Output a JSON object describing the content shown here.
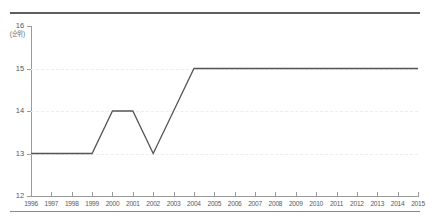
{
  "chart_data": {
    "type": "line",
    "title": "",
    "subtitle": "",
    "xlabel": "",
    "ylabel": "",
    "unit_label": "(순위)",
    "grid": true,
    "grid_orientation": "horizontal",
    "legend": false,
    "legend_position": "none",
    "y_axis_inverted": false,
    "xlim": [
      1996,
      2015
    ],
    "ylim": [
      12,
      16
    ],
    "ytick_labels": [
      "16",
      "15",
      "14",
      "13",
      "12"
    ],
    "ytick_values": [
      16,
      15,
      14,
      13,
      12
    ],
    "gridline_values": [
      15,
      14,
      13
    ],
    "xtick_labels": [
      "1996",
      "1997",
      "1998",
      "1999",
      "2000",
      "2001",
      "2002",
      "2003",
      "2004",
      "2005",
      "2006",
      "2007",
      "2008",
      "2009",
      "2010",
      "2011",
      "2012",
      "2013",
      "2014",
      "2015"
    ],
    "categories": [
      1996,
      1997,
      1998,
      1999,
      2000,
      2001,
      2002,
      2003,
      2004,
      2005,
      2006,
      2007,
      2008,
      2009,
      2010,
      2011,
      2012,
      2013,
      2014,
      2015
    ],
    "x": [
      1996,
      1997,
      1998,
      1999,
      2000,
      2001,
      2002,
      2003,
      2004,
      2005,
      2006,
      2007,
      2008,
      2009,
      2010,
      2011,
      2012,
      2013,
      2014,
      2015
    ],
    "values": [
      13,
      13,
      13,
      13,
      14,
      14,
      13,
      14,
      15,
      15,
      15,
      15,
      15,
      15,
      15,
      15,
      15,
      15,
      15,
      15
    ],
    "series": [
      {
        "name": "rank",
        "color": "#565656",
        "values": [
          13,
          13,
          13,
          13,
          14,
          14,
          13,
          14,
          15,
          15,
          15,
          15,
          15,
          15,
          15,
          15,
          15,
          15,
          15,
          15
        ]
      }
    ],
    "annotations": []
  },
  "style": {
    "line_color": "#565656",
    "axis_color": "#9a9a9a",
    "grid_color": "#eeecec",
    "rule_color": "#5e5e5e",
    "tick_label_color": "#58585a",
    "background": "#ffffff"
  }
}
